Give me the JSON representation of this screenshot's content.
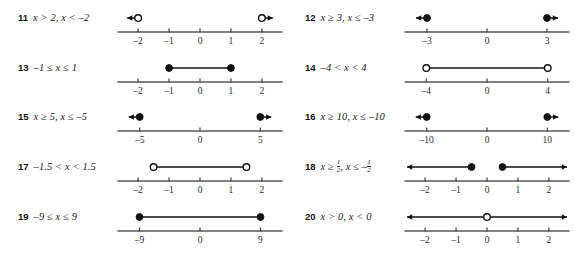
{
  "page": {
    "kind": "math-worksheet-answer-key",
    "background_color": "#ffffff",
    "ink_color": "#1a1a1a",
    "columns": 2,
    "rows": 5
  },
  "problems": [
    {
      "number": "11",
      "expression": "x > 2, x < –2",
      "column": "left",
      "row": 1,
      "axis": {
        "min": -2.65,
        "max": 2.65,
        "ticks": [
          -2,
          -1,
          0,
          1,
          2
        ],
        "tick_labels": [
          "–2",
          "–1",
          "0",
          "1",
          "2"
        ]
      },
      "graph": {
        "type": "two-rays",
        "marks": [
          {
            "at": -2,
            "filled": false,
            "ray": "left",
            "ray_length": "short"
          },
          {
            "at": 2,
            "filled": false,
            "ray": "right",
            "ray_length": "short"
          }
        ]
      }
    },
    {
      "number": "12",
      "expression": "x ≥ 3, x ≤ –3",
      "column": "right",
      "row": 1,
      "axis": {
        "min": -4.1,
        "max": 4.1,
        "ticks": [
          -3,
          0,
          3
        ],
        "tick_labels": [
          "–3",
          "0",
          "3"
        ]
      },
      "graph": {
        "type": "two-rays",
        "marks": [
          {
            "at": -3,
            "filled": true,
            "ray": "left",
            "ray_length": "short"
          },
          {
            "at": 3,
            "filled": true,
            "ray": "right",
            "ray_length": "short"
          }
        ]
      }
    },
    {
      "number": "13",
      "expression": "–1 ≤ x ≤ 1",
      "column": "left",
      "row": 2,
      "axis": {
        "min": -2.65,
        "max": 2.65,
        "ticks": [
          -2,
          -1,
          0,
          1,
          2
        ],
        "tick_labels": [
          "–2",
          "–1",
          "0",
          "1",
          "2"
        ]
      },
      "graph": {
        "type": "segment",
        "marks": [
          {
            "at": -1,
            "filled": true
          },
          {
            "at": 1,
            "filled": true
          }
        ]
      }
    },
    {
      "number": "14",
      "expression": "–4 < x < 4",
      "column": "right",
      "row": 2,
      "axis": {
        "min": -5.4,
        "max": 5.4,
        "ticks": [
          -4,
          0,
          4
        ],
        "tick_labels": [
          "–4",
          "0",
          "4"
        ]
      },
      "graph": {
        "type": "segment",
        "marks": [
          {
            "at": -4,
            "filled": false
          },
          {
            "at": 4,
            "filled": false
          }
        ]
      }
    },
    {
      "number": "15",
      "expression": "x ≥ 5, x ≤ –5",
      "column": "left",
      "row": 3,
      "axis": {
        "min": -6.8,
        "max": 6.8,
        "ticks": [
          -5,
          0,
          5
        ],
        "tick_labels": [
          "–5",
          "0",
          "5"
        ]
      },
      "graph": {
        "type": "two-rays",
        "marks": [
          {
            "at": -5,
            "filled": true,
            "ray": "left",
            "ray_length": "short"
          },
          {
            "at": 5,
            "filled": true,
            "ray": "right",
            "ray_length": "short"
          }
        ]
      }
    },
    {
      "number": "16",
      "expression": "x ≥ 10, x ≤ –10",
      "column": "right",
      "row": 3,
      "axis": {
        "min": -13.6,
        "max": 13.6,
        "ticks": [
          -10,
          0,
          10
        ],
        "tick_labels": [
          "–10",
          "0",
          "10"
        ]
      },
      "graph": {
        "type": "two-rays",
        "marks": [
          {
            "at": -10,
            "filled": true,
            "ray": "left",
            "ray_length": "short"
          },
          {
            "at": 10,
            "filled": true,
            "ray": "right",
            "ray_length": "short"
          }
        ]
      }
    },
    {
      "number": "17",
      "expression": "–1.5 < x < 1.5",
      "column": "left",
      "row": 4,
      "axis": {
        "min": -2.65,
        "max": 2.65,
        "ticks": [
          -2,
          -1,
          0,
          1,
          2
        ],
        "tick_labels": [
          "–2",
          "–1",
          "0",
          "1",
          "2"
        ]
      },
      "graph": {
        "type": "segment",
        "marks": [
          {
            "at": -1.5,
            "filled": false
          },
          {
            "at": 1.5,
            "filled": false
          }
        ]
      }
    },
    {
      "number": "18",
      "expression_parts": {
        "lead": "x ≥ ",
        "frac1_num": "1",
        "frac1_den": "2",
        "mid": ", x ≤ –",
        "frac2_num": "1",
        "frac2_den": "2"
      },
      "expression": "x ≥ 1/2, x ≤ –1/2",
      "column": "right",
      "row": 4,
      "axis": {
        "min": -2.65,
        "max": 2.65,
        "ticks": [
          -2,
          -1,
          0,
          1,
          2
        ],
        "tick_labels": [
          "–2",
          "–1",
          "0",
          "1",
          "2"
        ]
      },
      "graph": {
        "type": "two-rays",
        "marks": [
          {
            "at": -0.5,
            "filled": true,
            "ray": "left",
            "ray_length": "long"
          },
          {
            "at": 0.5,
            "filled": true,
            "ray": "right",
            "ray_length": "long"
          }
        ]
      }
    },
    {
      "number": "19",
      "expression": "–9 ≤ x ≤ 9",
      "column": "left",
      "row": 5,
      "axis": {
        "min": -12.2,
        "max": 12.2,
        "ticks": [
          -9,
          0,
          9
        ],
        "tick_labels": [
          "–9",
          "0",
          "9"
        ]
      },
      "graph": {
        "type": "segment",
        "marks": [
          {
            "at": -9,
            "filled": true
          },
          {
            "at": 9,
            "filled": true
          }
        ]
      }
    },
    {
      "number": "20",
      "expression": "x > 0, x < 0",
      "column": "right",
      "row": 5,
      "axis": {
        "min": -2.65,
        "max": 2.65,
        "ticks": [
          -2,
          -1,
          0,
          1,
          2
        ],
        "tick_labels": [
          "–2",
          "–1",
          "0",
          "1",
          "2"
        ]
      },
      "graph": {
        "type": "two-rays",
        "marks": [
          {
            "at": 0,
            "filled": false,
            "ray": "left",
            "ray_length": "long"
          },
          {
            "at": 0,
            "filled": false,
            "ray": "right",
            "ray_length": "long"
          }
        ]
      }
    }
  ]
}
